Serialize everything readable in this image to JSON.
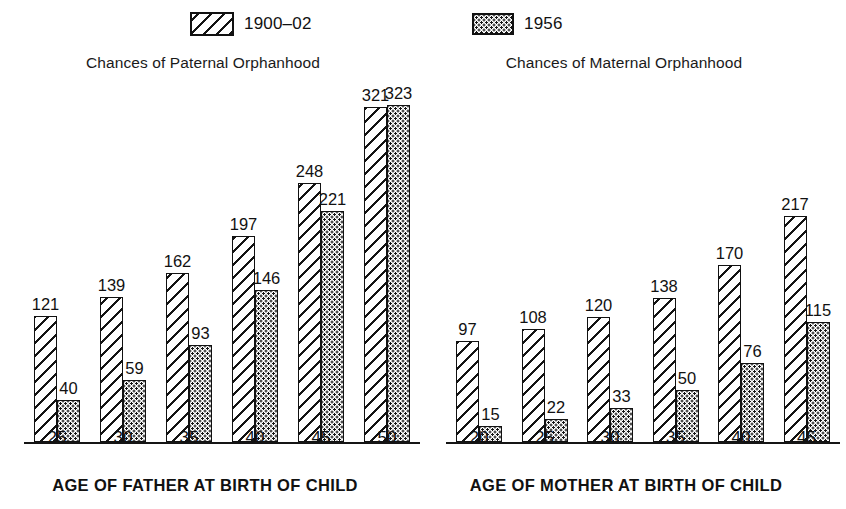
{
  "legend": {
    "items": [
      {
        "label": "1900–02",
        "pattern": "hatch"
      },
      {
        "label": "1956",
        "pattern": "dots"
      }
    ]
  },
  "chart_data": [
    {
      "type": "bar",
      "title": "Chances of Paternal Orphanhood",
      "xlabel": "AGE OF FATHER AT BIRTH OF CHILD",
      "ylabel": "",
      "categories": [
        "25",
        "30",
        "35",
        "40",
        "45",
        "50"
      ],
      "series": [
        {
          "name": "1900–02",
          "values": [
            121,
            139,
            162,
            197,
            248,
            321
          ]
        },
        {
          "name": "1956",
          "values": [
            40,
            59,
            93,
            146,
            221,
            323
          ]
        }
      ],
      "ylim": [
        0,
        360
      ],
      "grid": false,
      "legend_position": "top"
    },
    {
      "type": "bar",
      "title": "Chances of Maternal Orphanhood",
      "xlabel": "AGE OF MOTHER AT BIRTH OF CHILD",
      "ylabel": "",
      "categories": [
        "20",
        "25",
        "30",
        "35",
        "40",
        "45"
      ],
      "series": [
        {
          "name": "1900–02",
          "values": [
            97,
            108,
            120,
            138,
            170,
            217
          ]
        },
        {
          "name": "1956",
          "values": [
            15,
            22,
            33,
            50,
            76,
            115
          ]
        }
      ],
      "ylim": [
        0,
        360
      ],
      "grid": false,
      "legend_position": "top"
    }
  ],
  "colors": {
    "ink": "#141414",
    "background": "#ffffff"
  }
}
